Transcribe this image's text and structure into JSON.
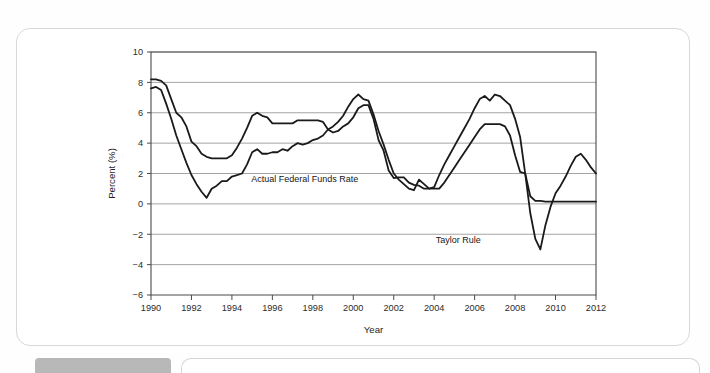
{
  "figure": {
    "ghost_text_1": "nd Figure Trends and the Taylor Rule",
    "ghost_text_2": "s: Trends and the Taylor Rule"
  },
  "chart_data": {
    "type": "line",
    "title": "",
    "xlabel": "Year",
    "ylabel": "Percent (%)",
    "xlim": [
      1990,
      2012
    ],
    "ylim": [
      -6,
      10
    ],
    "xticks": [
      1990,
      1992,
      1994,
      1996,
      1998,
      2000,
      2002,
      2004,
      2006,
      2008,
      2010,
      2012
    ],
    "yticks": [
      10,
      8,
      6,
      4,
      2,
      0,
      -2,
      -4,
      -6
    ],
    "xtick_labels": [
      "1990",
      "1992",
      "1994",
      "1996",
      "1998",
      "2000",
      "2002",
      "2004",
      "2006",
      "2008",
      "2010",
      "2012"
    ],
    "ytick_labels": [
      "10",
      "8",
      "6",
      "4",
      "2",
      "0",
      "−2",
      "−4",
      "−6"
    ],
    "grid": "horizontal",
    "legend": "inline-annotations",
    "line_color": "#1a1a1a",
    "series": [
      {
        "name": "Actual Federal Funds Rate",
        "label_x": 1997.6,
        "label_y": 1.45,
        "x": [
          1990.0,
          1990.25,
          1990.5,
          1990.75,
          1991.0,
          1991.25,
          1991.5,
          1991.75,
          1992.0,
          1992.25,
          1992.5,
          1992.75,
          1993.0,
          1993.25,
          1993.5,
          1993.75,
          1994.0,
          1994.25,
          1994.5,
          1994.75,
          1995.0,
          1995.25,
          1995.5,
          1995.75,
          1996.0,
          1996.25,
          1996.5,
          1996.75,
          1997.0,
          1997.25,
          1997.5,
          1997.75,
          1998.0,
          1998.25,
          1998.5,
          1998.75,
          1999.0,
          1999.25,
          1999.5,
          1999.75,
          2000.0,
          2000.25,
          2000.5,
          2000.75,
          2001.0,
          2001.25,
          2001.5,
          2001.75,
          2002.0,
          2002.25,
          2002.5,
          2002.75,
          2003.0,
          2003.25,
          2003.5,
          2003.75,
          2004.0,
          2004.25,
          2004.5,
          2004.75,
          2005.0,
          2005.25,
          2005.5,
          2005.75,
          2006.0,
          2006.25,
          2006.5,
          2006.75,
          2007.0,
          2007.25,
          2007.5,
          2007.75,
          2008.0,
          2008.25,
          2008.5,
          2008.75,
          2009.0,
          2009.25,
          2009.5,
          2009.75,
          2010.0,
          2010.5,
          2011.0,
          2011.5,
          2012.0
        ],
        "y": [
          8.2,
          8.2,
          8.1,
          7.8,
          6.9,
          6.0,
          5.7,
          5.1,
          4.1,
          3.8,
          3.3,
          3.1,
          3.0,
          3.0,
          3.0,
          3.0,
          3.2,
          3.7,
          4.3,
          5.0,
          5.8,
          6.0,
          5.8,
          5.7,
          5.3,
          5.3,
          5.3,
          5.3,
          5.3,
          5.5,
          5.5,
          5.5,
          5.5,
          5.5,
          5.4,
          4.9,
          4.7,
          4.8,
          5.1,
          5.3,
          5.7,
          6.3,
          6.5,
          6.5,
          5.6,
          4.2,
          3.5,
          2.2,
          1.7,
          1.75,
          1.75,
          1.4,
          1.25,
          1.2,
          1.0,
          1.0,
          1.0,
          1.0,
          1.4,
          1.9,
          2.4,
          2.9,
          3.4,
          3.9,
          4.4,
          4.9,
          5.25,
          5.25,
          5.25,
          5.25,
          5.1,
          4.5,
          3.2,
          2.1,
          2.0,
          0.5,
          0.2,
          0.2,
          0.15,
          0.15,
          0.15,
          0.15,
          0.15,
          0.15,
          0.15
        ]
      },
      {
        "name": "Taylor Rule",
        "label_x": 2006.3,
        "label_y": -2.55,
        "x": [
          1990.0,
          1990.25,
          1990.5,
          1990.75,
          1991.0,
          1991.25,
          1991.5,
          1991.75,
          1992.0,
          1992.25,
          1992.5,
          1992.75,
          1993.0,
          1993.25,
          1993.5,
          1993.75,
          1994.0,
          1994.25,
          1994.5,
          1994.75,
          1995.0,
          1995.25,
          1995.5,
          1995.75,
          1996.0,
          1996.25,
          1996.5,
          1996.75,
          1997.0,
          1997.25,
          1997.5,
          1997.75,
          1998.0,
          1998.25,
          1998.5,
          1998.75,
          1999.0,
          1999.25,
          1999.5,
          1999.75,
          2000.0,
          2000.25,
          2000.5,
          2000.75,
          2001.0,
          2001.25,
          2001.5,
          2001.75,
          2002.0,
          2002.25,
          2002.5,
          2002.75,
          2003.0,
          2003.25,
          2003.5,
          2003.75,
          2004.0,
          2004.25,
          2004.5,
          2004.75,
          2005.0,
          2005.25,
          2005.5,
          2005.75,
          2006.0,
          2006.25,
          2006.5,
          2006.75,
          2007.0,
          2007.25,
          2007.5,
          2007.75,
          2008.0,
          2008.25,
          2008.5,
          2008.75,
          2009.0,
          2009.25,
          2009.5,
          2009.75,
          2010.0,
          2010.25,
          2010.5,
          2010.75,
          2011.0,
          2011.25,
          2011.5,
          2011.75,
          2012.0
        ],
        "y": [
          7.6,
          7.7,
          7.5,
          6.6,
          5.6,
          4.5,
          3.6,
          2.7,
          1.9,
          1.3,
          0.8,
          0.4,
          1.0,
          1.2,
          1.5,
          1.5,
          1.8,
          1.9,
          2.0,
          2.6,
          3.4,
          3.6,
          3.3,
          3.3,
          3.4,
          3.4,
          3.6,
          3.5,
          3.8,
          4.0,
          3.9,
          4.0,
          4.2,
          4.3,
          4.5,
          4.9,
          5.1,
          5.4,
          5.8,
          6.4,
          6.9,
          7.2,
          6.9,
          6.8,
          5.9,
          4.8,
          3.9,
          2.9,
          2.0,
          1.6,
          1.3,
          1.0,
          0.9,
          1.6,
          1.3,
          1.0,
          1.1,
          1.9,
          2.6,
          3.2,
          3.8,
          4.4,
          5.0,
          5.6,
          6.3,
          6.9,
          7.1,
          6.8,
          7.2,
          7.1,
          6.8,
          6.5,
          5.6,
          4.4,
          2.0,
          -0.6,
          -2.3,
          -3.0,
          -1.4,
          -0.2,
          0.7,
          1.2,
          1.8,
          2.5,
          3.1,
          3.3,
          2.9,
          2.4,
          2.0
        ]
      }
    ]
  }
}
